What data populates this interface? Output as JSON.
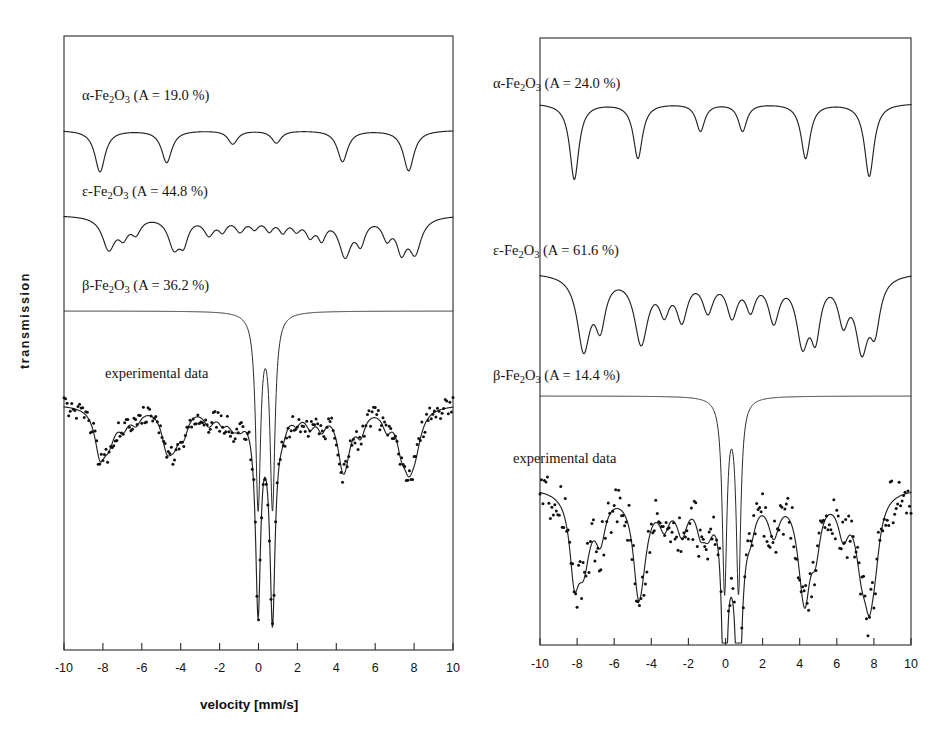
{
  "figure": {
    "panels": [
      {
        "id": "left",
        "axis": {
          "xlabel": "velocity [mm/s]",
          "ylabel": "transmission",
          "xmin": -10,
          "xmax": 10,
          "xticks": [
            -10,
            -8,
            -6,
            -4,
            -2,
            0,
            2,
            4,
            6,
            8,
            10
          ],
          "xticklabels": [
            "-10",
            "-8",
            "-6",
            "-4",
            "-2",
            "0",
            "2",
            "4",
            "6",
            "8",
            "10"
          ]
        },
        "components": [
          {
            "name": "alpha-Fe2O3",
            "label_greek": "α",
            "label_formula": "-Fe2O3",
            "label_area": "(A = 19.0 %)",
            "label_full": "α-Fe₂O₃ (A = 19.0 %)",
            "area_percent": 19.0,
            "type": "sextet",
            "positions": [
              -8.15,
              -4.72,
              -1.32,
              0.92,
              4.32,
              7.72
            ],
            "depths": [
              0.8,
              0.62,
              0.26,
              0.24,
              0.6,
              0.78
            ],
            "widths": [
              0.32,
              0.32,
              0.3,
              0.3,
              0.32,
              0.33
            ]
          },
          {
            "name": "epsilon-Fe2O3",
            "label_greek": "ε",
            "label_formula": "-Fe2O3",
            "label_area": "(A = 44.8 %)",
            "label_full": "ε-Fe₂O₃ (A = 44.8 %)",
            "area_percent": 44.8,
            "type": "multi-sextet",
            "positions": [
              -7.7,
              -6.95,
              -6.3,
              -4.35,
              -3.85,
              -2.55,
              -1.85,
              -0.95,
              -0.2,
              0.55,
              1.25,
              1.95,
              2.65,
              3.25,
              4.45,
              5.25,
              6.6,
              7.35,
              8.05
            ],
            "depths": [
              0.58,
              0.3,
              0.26,
              0.52,
              0.4,
              0.3,
              0.22,
              0.24,
              0.18,
              0.22,
              0.24,
              0.2,
              0.3,
              0.34,
              0.68,
              0.42,
              0.34,
              0.55,
              0.62
            ],
            "widths": [
              0.4,
              0.3,
              0.3,
              0.36,
              0.28,
              0.32,
              0.26,
              0.3,
              0.26,
              0.26,
              0.26,
              0.26,
              0.28,
              0.26,
              0.38,
              0.28,
              0.28,
              0.3,
              0.38
            ]
          },
          {
            "name": "beta-Fe2O3",
            "label_greek": "β",
            "label_formula": "-Fe2O3",
            "label_area": "(A = 36.2 %)",
            "label_full": "β-Fe₂O₃ (A = 36.2 %)",
            "area_percent": 36.2,
            "type": "doublet",
            "positions": [
              -0.02,
              0.72
            ],
            "depths": [
              3.7,
              3.7
            ],
            "widths": [
              0.155,
              0.155
            ]
          }
        ],
        "experimental": {
          "label": "experimental data",
          "marker": "dots",
          "noise_amplitude": 0.03,
          "point_count": 250
        }
      },
      {
        "id": "right",
        "axis": {
          "xlabel": "velocity [mm/s]",
          "ylabel": "transmission",
          "xmin": -10,
          "xmax": 10,
          "xticks": [
            -10,
            -8,
            -6,
            -4,
            -2,
            0,
            2,
            4,
            6,
            8,
            10
          ],
          "xticklabels": [
            "-10",
            "-8",
            "-6",
            "-4",
            "-2",
            "0",
            "2",
            "4",
            "6",
            "8",
            "10"
          ]
        },
        "components": [
          {
            "name": "alpha-Fe2O3",
            "label_greek": "α",
            "label_formula": "-Fe2O3",
            "label_area": "(A = 24.0 %)",
            "label_full": "α-Fe₂O₃ (A = 24.0 %)",
            "area_percent": 24.0,
            "type": "sextet",
            "positions": [
              -8.15,
              -4.72,
              -1.35,
              0.92,
              4.32,
              7.75
            ],
            "depths": [
              1.0,
              0.72,
              0.36,
              0.36,
              0.72,
              0.96
            ],
            "widths": [
              0.3,
              0.3,
              0.28,
              0.28,
              0.3,
              0.31
            ]
          },
          {
            "name": "epsilon-Fe2O3",
            "label_greek": "ε",
            "label_formula": "-Fe2O3",
            "label_area": "(A = 61.6 %)",
            "label_full": "ε-Fe₂O₃ (A = 61.6 %)",
            "area_percent": 61.6,
            "type": "multi-sextet",
            "positions": [
              -7.65,
              -6.75,
              -4.55,
              -3.3,
              -2.35,
              -0.95,
              0.35,
              1.35,
              2.6,
              4.15,
              4.85,
              6.35,
              7.35,
              8.05
            ],
            "depths": [
              0.92,
              0.58,
              0.84,
              0.4,
              0.52,
              0.42,
              0.48,
              0.38,
              0.54,
              0.8,
              0.66,
              0.52,
              0.86,
              0.6
            ],
            "widths": [
              0.42,
              0.34,
              0.44,
              0.34,
              0.36,
              0.36,
              0.36,
              0.32,
              0.36,
              0.4,
              0.32,
              0.34,
              0.4,
              0.34
            ]
          },
          {
            "name": "beta-Fe2O3",
            "label_greek": "β",
            "label_formula": "-Fe2O3",
            "label_area": "(A = 14.4 %)",
            "label_full": "β-Fe₂O₃ (A = 14.4 %)",
            "area_percent": 14.4,
            "type": "doublet",
            "positions": [
              -0.05,
              0.7
            ],
            "depths": [
              3.1,
              3.1
            ],
            "widths": [
              0.15,
              0.15
            ]
          }
        ],
        "experimental": {
          "label": "experimental data",
          "marker": "dots",
          "noise_amplitude": 0.045,
          "point_count": 250
        }
      }
    ]
  },
  "chart_data": {
    "type": "line",
    "title": "",
    "xlabel": "velocity [mm/s]",
    "ylabel": "transmission",
    "xlim": [
      -10,
      10
    ],
    "grid": false,
    "legend": "none",
    "panels": [
      {
        "panel": "left",
        "series": [
          {
            "name": "α-Fe₂O₃ (A = 19.0 %)",
            "area_percent": 19.0,
            "line_positions_mm_s": [
              -8.15,
              -4.72,
              -1.32,
              0.92,
              4.32,
              7.72
            ]
          },
          {
            "name": "ε-Fe₂O₃ (A = 44.8 %)",
            "area_percent": 44.8,
            "line_positions_mm_s": [
              -7.7,
              -6.95,
              -6.3,
              -4.35,
              -3.85,
              -2.55,
              -1.85,
              -0.95,
              -0.2,
              0.55,
              1.25,
              1.95,
              2.65,
              3.25,
              4.45,
              5.25,
              6.6,
              7.35,
              8.05
            ]
          },
          {
            "name": "β-Fe₂O₃ (A = 36.2 %)",
            "area_percent": 36.2,
            "line_positions_mm_s": [
              -0.02,
              0.72
            ]
          },
          {
            "name": "experimental data",
            "marker": "dots"
          }
        ]
      },
      {
        "panel": "right",
        "series": [
          {
            "name": "α-Fe₂O₃ (A = 24.0 %)",
            "area_percent": 24.0,
            "line_positions_mm_s": [
              -8.15,
              -4.72,
              -1.35,
              0.92,
              4.32,
              7.75
            ]
          },
          {
            "name": "ε-Fe₂O₃ (A = 61.6 %)",
            "area_percent": 61.6,
            "line_positions_mm_s": [
              -7.65,
              -6.75,
              -4.55,
              -3.3,
              -2.35,
              -0.95,
              0.35,
              1.35,
              2.6,
              4.15,
              4.85,
              6.35,
              7.35,
              8.05
            ]
          },
          {
            "name": "β-Fe₂O₃ (A = 14.4 %)",
            "area_percent": 14.4,
            "line_positions_mm_s": [
              -0.05,
              0.7
            ]
          },
          {
            "name": "experimental data",
            "marker": "dots"
          }
        ]
      }
    ]
  }
}
